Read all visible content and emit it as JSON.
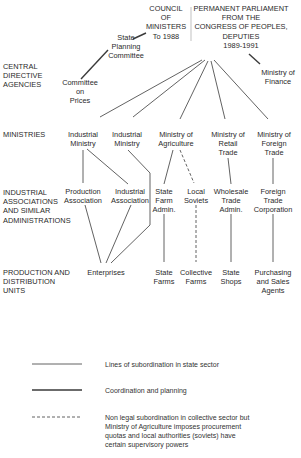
{
  "top": {
    "council": [
      "COUNCIL",
      "OF",
      "MINISTERS",
      "To 1988"
    ],
    "parliament": [
      "PERMANENT PARLIAMENT",
      "FROM THE",
      "CONGRESS OF PEOPLES,",
      "DEPUTIES",
      "1989-1991"
    ]
  },
  "central": {
    "state_planning": [
      "State",
      "Planning",
      "Committee"
    ],
    "committee_prices": [
      "Committee",
      "on",
      "Prices"
    ],
    "ministry_finance": [
      "Ministry of",
      "Finance"
    ]
  },
  "rows": {
    "central": [
      "CENTRAL",
      "DIRECTIVE",
      "AGENCIES"
    ],
    "ministries": [
      "MINISTRIES"
    ],
    "associations": [
      "INDUSTRIAL",
      "ASSOCIATIONS",
      "AND SIMILAR",
      "ADMINISTRATIONS"
    ],
    "production": [
      "PRODUCTION AND",
      "DISTRIBUTION",
      "UNITS"
    ]
  },
  "ministries": [
    [
      "Industrial",
      "Ministry"
    ],
    [
      "Industrial",
      "Ministry"
    ],
    [
      "Ministry of",
      "Agriculture"
    ],
    [
      "Ministry of",
      "Retail",
      "Trade"
    ],
    [
      "Ministry of",
      "Foreign",
      "Trade"
    ]
  ],
  "associations": [
    [
      "Production",
      "Association"
    ],
    [
      "Industrial",
      "Association"
    ],
    [
      "State",
      "Farm",
      "Admin."
    ],
    [
      "Local",
      "Soviets"
    ],
    [
      "Wholesale",
      "Trade",
      "Admin."
    ],
    [
      "Foreign",
      "Trade",
      "Corporation"
    ]
  ],
  "units": [
    [
      "Enterprises"
    ],
    [
      "State",
      "Farms"
    ],
    [
      "Collective",
      "Farms"
    ],
    [
      "State",
      "Shops"
    ],
    [
      "Purchasing",
      "and Sales",
      "Agents"
    ]
  ],
  "legend": [
    {
      "style": "thin",
      "text": [
        "Lines of subordination in state sector"
      ]
    },
    {
      "style": "thick",
      "text": [
        "Coordination and planning"
      ]
    },
    {
      "style": "dashed",
      "text": [
        "Non legal subordination in collective sector but",
        "Ministry of Agriculture imposes procurement",
        "quotas and local authorities (soviets) have",
        "certain supervisory powers"
      ]
    }
  ]
}
